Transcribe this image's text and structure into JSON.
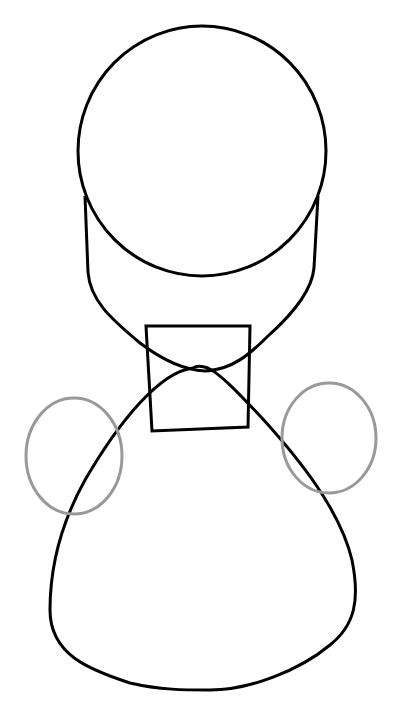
{
  "figure": {
    "colors": {
      "background": "#ffffff",
      "outline": "#000000",
      "secondary_outline": "#999999"
    },
    "shapes": [
      {
        "id": "head",
        "type": "ellipse",
        "cx": 202,
        "cy": 151,
        "rx": 124,
        "ry": 125,
        "stroke": "#000000"
      },
      {
        "id": "jaw",
        "type": "path",
        "stroke": "#000000"
      },
      {
        "id": "neck-box",
        "type": "polygon",
        "points": "146,326 250,326 248,427 152,431",
        "stroke": "#000000"
      },
      {
        "id": "body",
        "type": "path",
        "stroke": "#000000"
      },
      {
        "id": "left-ellipse",
        "type": "ellipse",
        "cx": 74,
        "cy": 456,
        "rx": 48,
        "ry": 58,
        "stroke": "#999999"
      },
      {
        "id": "right-ellipse",
        "type": "ellipse",
        "cx": 329,
        "cy": 438,
        "rx": 47,
        "ry": 55,
        "stroke": "#999999"
      }
    ]
  }
}
